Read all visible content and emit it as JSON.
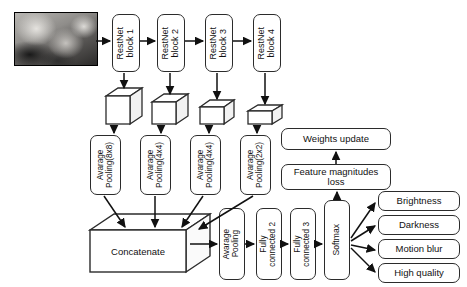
{
  "diagram": {
    "input_image_alt": "endoscopic-frame",
    "backbone": [
      {
        "label": "RestNet\nblock 1"
      },
      {
        "label": "RestNet\nblock 2"
      },
      {
        "label": "RestNet\nblock 3"
      },
      {
        "label": "RestNet\nblock 4"
      }
    ],
    "feature_maps": [
      {
        "name": "feature-map-1"
      },
      {
        "name": "feature-map-2"
      },
      {
        "name": "feature-map-3"
      },
      {
        "name": "feature-map-4"
      }
    ],
    "pooling": [
      {
        "label": "Avarage\nPooling(8x8)"
      },
      {
        "label": "Avarage\nPooling(4x4)"
      },
      {
        "label": "Avarage\nPooling(4x4)"
      },
      {
        "label": "Avarage\nPooling(2x2)"
      }
    ],
    "concatenate": {
      "label": "Concatenate"
    },
    "head": [
      {
        "label": "Avarage\nPooling"
      },
      {
        "label": "Fully\nconnected 2"
      },
      {
        "label": "Fully\nconnected 3"
      },
      {
        "label": "Softmax"
      }
    ],
    "loss_branch": [
      {
        "label": "Weights update"
      },
      {
        "label": "Feature magnitudes\nloss"
      }
    ],
    "outputs": [
      {
        "label": "Brightness"
      },
      {
        "label": "Darkness"
      },
      {
        "label": "Motion blur"
      },
      {
        "label": "High quality"
      }
    ],
    "colors": {
      "stroke": "#2b2b2b",
      "arrow": "#111111",
      "background": "#ffffff",
      "text": "#111111"
    }
  }
}
